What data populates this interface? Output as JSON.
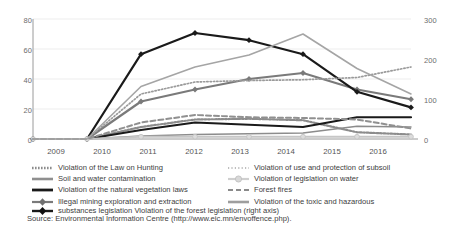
{
  "chart_data": {
    "type": "line",
    "title": "",
    "xlabel": "",
    "ylabel": "",
    "categories": [
      "2009",
      "2010",
      "2011",
      "2012",
      "2013",
      "2014",
      "2015",
      "2016"
    ],
    "axes": {
      "left": {
        "ticks": [
          "0",
          "20",
          "40",
          "60",
          "80"
        ],
        "min": 0,
        "max": 80
      },
      "right": {
        "ticks": [
          "0",
          "100",
          "200",
          "300"
        ],
        "min": 0,
        "max": 300,
        "label": "right axis"
      }
    },
    "grid": true,
    "legend_position": "below",
    "series": [
      {
        "name": "Violation of the Law on Hunting",
        "axis": "left",
        "style": "dotted",
        "color": "#8c8c8c",
        "marker": "none",
        "values": [
          0,
          0,
          8,
          13,
          13.5,
          12.5,
          4.5,
          3
        ]
      },
      {
        "name": "Soil and water contamination",
        "axis": "left",
        "style": "solid",
        "color": "#8c8c8c",
        "marker": "none",
        "values": [
          0,
          0,
          2,
          3,
          3.5,
          4,
          8.5,
          8
        ]
      },
      {
        "name": "Violation of the natural vegetation laws",
        "axis": "left",
        "style": "solid-thick",
        "color": "#1a1a1a",
        "marker": "none",
        "values": [
          0,
          0,
          6,
          11,
          9.5,
          8,
          14.5,
          14.5
        ]
      },
      {
        "name": "Illegal mining exploration and extraction",
        "axis": "left",
        "style": "solid-marker",
        "color": "#7a7a7a",
        "marker": "diamond",
        "values": [
          0,
          0,
          25,
          33,
          40,
          44,
          33,
          26.5
        ]
      },
      {
        "name": "substances legislation Violation of the forest legislation (right axis)",
        "axis": "right",
        "style": "solid-marker",
        "color": "#1a1a1a",
        "marker": "diamond",
        "values": [
          0,
          0,
          212,
          265,
          247,
          212,
          118,
          79
        ]
      },
      {
        "name": "Violation of use and protection of subsoil",
        "axis": "left",
        "style": "dotted-fine",
        "color": "#9a9a9a",
        "marker": "none",
        "values": [
          0,
          0,
          30,
          38,
          39,
          39.5,
          41,
          48
        ]
      },
      {
        "name": "Violation of legislation on water",
        "axis": "left",
        "style": "solid-light-marker",
        "color": "#c6c6c6",
        "marker": "circle",
        "values": [
          0,
          0,
          1.5,
          1.5,
          1.5,
          1.5,
          1.5,
          1.5
        ]
      },
      {
        "name": "Forest fires",
        "axis": "left",
        "style": "dashed",
        "color": "#909090",
        "marker": "none",
        "values": [
          0,
          0,
          11,
          16,
          14.5,
          14,
          13,
          7
        ]
      },
      {
        "name": "Violation of the toxic and hazardous",
        "axis": "left",
        "style": "solid-gray",
        "color": "#a5a5a5",
        "marker": "none",
        "values": [
          0,
          0,
          35,
          48,
          56,
          70,
          47,
          30
        ]
      }
    ]
  },
  "legend": {
    "left_column": [
      {
        "label": "Violation of the Law on Hunting",
        "key": "dotted-key"
      },
      {
        "label": "Soil and water contamination",
        "key": "gray-solid-key"
      },
      {
        "label": "Violation of the natural vegetation laws",
        "key": "black-thick-key"
      },
      {
        "label": "Illegal mining exploration and extraction",
        "key": "gray-diamond-key"
      }
    ],
    "right_column": [
      {
        "label": "Violation of use and protection of subsoil",
        "key": "fine-dotted-key"
      },
      {
        "label": "Violation of legislation on water",
        "key": "light-circle-key"
      },
      {
        "label": "Forest fires",
        "key": "dashed-key"
      },
      {
        "label": "Violation of the toxic and hazardous",
        "key": "gray-line-key"
      }
    ],
    "wide_item": {
      "label": "substances legislation Violation of the forest legislation (right axis)",
      "key": "black-diamond-key"
    }
  },
  "source": {
    "text": "Source: Environmental Information Centre (http://www.eic.mn/envoffence.php)."
  }
}
